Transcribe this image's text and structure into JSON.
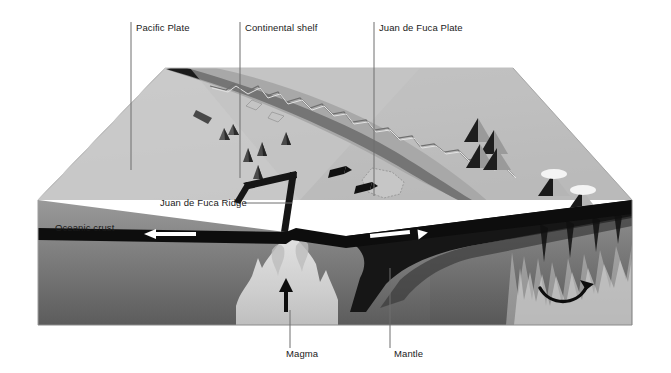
{
  "figure": {
    "type": "geological-cross-section-block-diagram",
    "background_color": "#ffffff",
    "label_color": "#1a1a1a",
    "leader_line_color": "#6e6e6e"
  },
  "labels": {
    "pacific_plate": "Pacific Plate",
    "continental_shelf": "Continental shelf",
    "juan_de_fuca_plate": "Juan de Fuca Plate",
    "juan_de_fuca_ridge": "Juan de Fuca Ridge",
    "oceanic_crust": "Oceanic crust",
    "magma": "Magma",
    "mantle": "Mantle"
  },
  "colors": {
    "surface_light": "#d2d2d2",
    "surface_mid": "#bdbdbd",
    "surface_dark": "#a9a9a9",
    "ocean_trench_band": "#8f8f8f",
    "crust_black": "#101010",
    "mantle_upper": "#8a8a8a",
    "mantle_lower": "#5f5f5f",
    "magma_plume": "#cfcfcf",
    "volcano_dark": "#1c1c1c",
    "volcano_snow": "#f2f2f2",
    "arrow_white": "#ffffff",
    "arrow_black": "#0d0d0d",
    "coastline": "#7a7a7a"
  },
  "features": {
    "oceanic_spreading_arrow_left": "white-arrow-left",
    "oceanic_spreading_arrow_right": "white-arrow-right",
    "magma_upwelling_arrow": "black-arrow-up",
    "mantle_convection_arrow": "black-arrow-curved",
    "plate_motion_arrows": "black-arrows-eastward",
    "volcano_count_dark": 5,
    "volcano_count_snowcapped": 2
  }
}
